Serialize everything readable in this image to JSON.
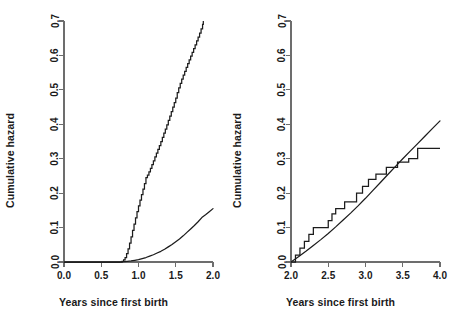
{
  "figure": {
    "background": "#ffffff",
    "line_color": "#1c1c1c",
    "axis_color": "#6d6d6d",
    "panel_count": 2
  },
  "panels": [
    {
      "name": "left-panel",
      "xlabel": "Years since first birth",
      "ylabel": "Cumulative hazard",
      "xticks": [
        "0.0",
        "0.5",
        "1.0",
        "1.5",
        "2.0"
      ],
      "yticks": [
        "0.0",
        "0.1",
        "0.2",
        "0.3",
        "0.4",
        "0.5",
        "0.6",
        "0.7"
      ]
    },
    {
      "name": "right-panel",
      "xlabel": "Years since first birth",
      "ylabel": "Cumulative hazard",
      "xticks": [
        "2.0",
        "2.5",
        "3.0",
        "3.5",
        "4.0"
      ],
      "yticks": [
        "0.0",
        "0.1",
        "0.2",
        "0.3",
        "0.4",
        "0.5",
        "0.6",
        "0.7"
      ]
    }
  ],
  "chart_data": [
    {
      "type": "line",
      "panel": "left",
      "title": "",
      "xlabel": "Years since first birth",
      "ylabel": "Cumulative hazard",
      "xlim": [
        0.0,
        2.0
      ],
      "ylim": [
        0.0,
        0.7
      ],
      "xticks": [
        0.0,
        0.5,
        1.0,
        1.5,
        2.0
      ],
      "yticks": [
        0.0,
        0.1,
        0.2,
        0.3,
        0.4,
        0.5,
        0.6,
        0.7
      ],
      "grid": false,
      "legend": "none",
      "series": [
        {
          "name": "Nelson-Aalen step estimate",
          "style": "step",
          "x": [
            0.0,
            0.7,
            0.78,
            0.8,
            0.82,
            0.84,
            0.86,
            0.88,
            0.9,
            0.92,
            0.94,
            0.96,
            0.98,
            1.0,
            1.02,
            1.04,
            1.06,
            1.08,
            1.1,
            1.12,
            1.14,
            1.16,
            1.18,
            1.2,
            1.22,
            1.24,
            1.26,
            1.28,
            1.3,
            1.32,
            1.34,
            1.36,
            1.38,
            1.4,
            1.42,
            1.44,
            1.46,
            1.48,
            1.5,
            1.52,
            1.54,
            1.56,
            1.58,
            1.6,
            1.62,
            1.64,
            1.66,
            1.68,
            1.7,
            1.72,
            1.74,
            1.76,
            1.78,
            1.8,
            1.82,
            1.84,
            1.86,
            1.87
          ],
          "y": [
            0.0,
            0.0,
            0.002,
            0.006,
            0.013,
            0.024,
            0.038,
            0.055,
            0.073,
            0.092,
            0.11,
            0.128,
            0.146,
            0.163,
            0.18,
            0.196,
            0.212,
            0.228,
            0.245,
            0.252,
            0.262,
            0.272,
            0.283,
            0.294,
            0.305,
            0.316,
            0.327,
            0.338,
            0.35,
            0.362,
            0.374,
            0.386,
            0.398,
            0.411,
            0.424,
            0.437,
            0.45,
            0.463,
            0.476,
            0.492,
            0.506,
            0.519,
            0.531,
            0.543,
            0.554,
            0.565,
            0.576,
            0.587,
            0.598,
            0.609,
            0.62,
            0.631,
            0.642,
            0.653,
            0.665,
            0.677,
            0.69,
            0.7
          ]
        },
        {
          "name": "Parametric smooth fit",
          "style": "smooth",
          "x": [
            0.0,
            0.2,
            0.4,
            0.6,
            0.75,
            0.8,
            0.85,
            0.9,
            0.95,
            1.0,
            1.05,
            1.1,
            1.15,
            1.2,
            1.25,
            1.3,
            1.35,
            1.4,
            1.45,
            1.5,
            1.55,
            1.6,
            1.65,
            1.7,
            1.75,
            1.8,
            1.85,
            1.9,
            1.95,
            2.0
          ],
          "y": [
            0.0,
            0.0,
            0.0,
            0.0,
            0.0,
            0.001,
            0.002,
            0.003,
            0.005,
            0.007,
            0.01,
            0.013,
            0.017,
            0.021,
            0.026,
            0.031,
            0.037,
            0.044,
            0.051,
            0.059,
            0.067,
            0.076,
            0.086,
            0.096,
            0.106,
            0.117,
            0.129,
            0.137,
            0.146,
            0.155
          ]
        }
      ]
    },
    {
      "type": "line",
      "panel": "right",
      "title": "",
      "xlabel": "Years since first birth",
      "ylabel": "Cumulative hazard",
      "xlim": [
        2.0,
        4.0
      ],
      "ylim": [
        0.0,
        0.7
      ],
      "xticks": [
        2.0,
        2.5,
        3.0,
        3.5,
        4.0
      ],
      "yticks": [
        0.0,
        0.1,
        0.2,
        0.3,
        0.4,
        0.5,
        0.6,
        0.7
      ],
      "grid": false,
      "legend": "none",
      "series": [
        {
          "name": "Nelson-Aalen step estimate",
          "style": "step",
          "x": [
            2.0,
            2.06,
            2.12,
            2.18,
            2.24,
            2.3,
            2.43,
            2.5,
            2.55,
            2.6,
            2.66,
            2.72,
            2.8,
            2.88,
            2.96,
            3.04,
            3.14,
            3.28,
            3.43,
            3.58,
            3.7,
            4.0
          ],
          "y": [
            0.0,
            0.02,
            0.04,
            0.06,
            0.08,
            0.1,
            0.1,
            0.12,
            0.14,
            0.155,
            0.155,
            0.175,
            0.175,
            0.2,
            0.22,
            0.24,
            0.255,
            0.275,
            0.29,
            0.3,
            0.33,
            0.33
          ]
        },
        {
          "name": "Parametric smooth fit",
          "style": "smooth",
          "x": [
            2.0,
            2.1,
            2.2,
            2.3,
            2.4,
            2.5,
            2.6,
            2.7,
            2.8,
            2.9,
            3.0,
            3.1,
            3.2,
            3.3,
            3.4,
            3.5,
            3.6,
            3.7,
            3.8,
            3.9,
            4.0
          ],
          "y": [
            0.0,
            0.015,
            0.031,
            0.048,
            0.065,
            0.083,
            0.102,
            0.122,
            0.142,
            0.163,
            0.185,
            0.208,
            0.231,
            0.254,
            0.277,
            0.3,
            0.322,
            0.344,
            0.366,
            0.388,
            0.41
          ]
        }
      ]
    }
  ]
}
